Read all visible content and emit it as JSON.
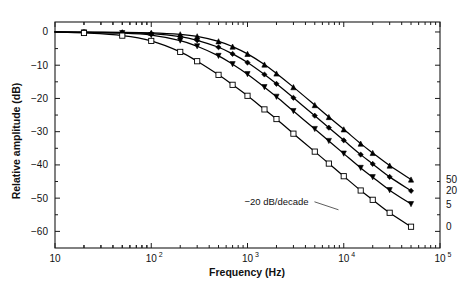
{
  "chart_data": {
    "type": "line",
    "title": "",
    "xlabel": "Frequency (Hz)",
    "ylabel": "Relative amplitude (dB)",
    "xscale": "log",
    "xlim": [
      10,
      100000
    ],
    "ylim": [
      -65,
      3
    ],
    "yticks": [
      0,
      -10,
      -20,
      -30,
      -40,
      -50,
      -60
    ],
    "ytick_labels": [
      "0",
      "-10",
      "-20",
      "-30",
      "-40",
      "-50",
      "-60"
    ],
    "xticks": [
      10,
      100,
      1000,
      10000,
      100000
    ],
    "xtick_labels": [
      "10",
      "10",
      "10",
      "10",
      "10"
    ],
    "xtick_exponents": [
      "",
      "2",
      "3",
      "4",
      "5"
    ],
    "grid": false,
    "legend_position": "right-inline",
    "annotations": [
      {
        "text": "-20 dB/decade",
        "x": 2000,
        "y": -52
      }
    ],
    "series": [
      {
        "name": "50",
        "label": "50",
        "marker": "triangle-filled",
        "x": [
          20,
          50,
          100,
          200,
          300,
          500,
          700,
          1000,
          1500,
          2000,
          3000,
          5000,
          7000,
          10000,
          15000,
          20000,
          30000,
          50000
        ],
        "y": [
          -0.05,
          -0.1,
          -0.25,
          -0.7,
          -1.3,
          -2.8,
          -4.4,
          -6.6,
          -9.8,
          -12.5,
          -16.6,
          -22.0,
          -25.6,
          -29.3,
          -33.6,
          -36.4,
          -40.2,
          -44.4
        ]
      },
      {
        "name": "20",
        "label": "20",
        "marker": "diamond-filled",
        "x": [
          20,
          50,
          100,
          200,
          300,
          500,
          700,
          1000,
          1500,
          2000,
          3000,
          5000,
          7000,
          10000,
          15000,
          20000,
          30000,
          50000
        ],
        "y": [
          -0.08,
          -0.2,
          -0.5,
          -1.4,
          -2.5,
          -4.6,
          -6.6,
          -9.2,
          -12.8,
          -15.6,
          -19.8,
          -25.2,
          -28.8,
          -32.6,
          -36.9,
          -39.7,
          -43.6,
          -47.8
        ]
      },
      {
        "name": "5",
        "label": "5",
        "marker": "triangle-down-filled",
        "x": [
          20,
          50,
          100,
          200,
          300,
          500,
          700,
          1000,
          1500,
          2000,
          3000,
          5000,
          7000,
          10000,
          15000,
          20000,
          30000,
          50000
        ],
        "y": [
          -0.12,
          -0.35,
          -0.95,
          -2.6,
          -4.3,
          -7.2,
          -9.7,
          -12.7,
          -16.6,
          -19.5,
          -23.8,
          -29.2,
          -32.8,
          -36.6,
          -40.9,
          -43.7,
          -47.6,
          -51.8
        ]
      },
      {
        "name": "0",
        "label": "0",
        "marker": "square-open",
        "x": [
          20,
          50,
          100,
          200,
          300,
          500,
          700,
          1000,
          1500,
          2000,
          3000,
          5000,
          7000,
          10000,
          15000,
          20000,
          30000,
          50000
        ],
        "y": [
          -0.3,
          -1.1,
          -2.7,
          -6.0,
          -8.8,
          -12.9,
          -15.9,
          -19.2,
          -23.3,
          -26.2,
          -30.6,
          -36.0,
          -39.6,
          -43.4,
          -47.7,
          -50.5,
          -54.4,
          -58.6
        ]
      }
    ]
  }
}
